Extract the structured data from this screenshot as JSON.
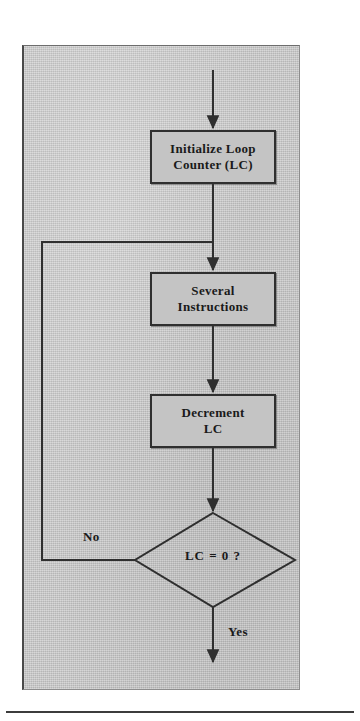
{
  "figure": {
    "panel": {
      "background_color": "#c9c9c9",
      "border_color": "#4a4a4a"
    },
    "nodes": [
      {
        "id": "initialize-loop-counter",
        "type": "process",
        "lines": [
          "Initialize Loop",
          "Counter (LC)"
        ]
      },
      {
        "id": "several-instructions",
        "type": "process",
        "lines": [
          "Several",
          "Instructions"
        ]
      },
      {
        "id": "decrement-lc",
        "type": "process",
        "lines": [
          "Decrement",
          "LC"
        ]
      },
      {
        "id": "lc-equals-zero",
        "type": "decision",
        "text": "LC = 0 ?"
      }
    ],
    "edges": [
      {
        "id": "entry-arrow",
        "from": "",
        "to": "initialize-loop-counter",
        "label": ""
      },
      {
        "id": "init-to-several",
        "from": "initialize-loop-counter",
        "to": "several-instructions",
        "label": ""
      },
      {
        "id": "several-to-decrement",
        "from": "several-instructions",
        "to": "decrement-lc",
        "label": ""
      },
      {
        "id": "decrement-to-decision",
        "from": "decrement-lc",
        "to": "lc-equals-zero",
        "label": ""
      },
      {
        "id": "decision-no-loopback",
        "from": "lc-equals-zero",
        "to": "several-instructions",
        "label": "No"
      },
      {
        "id": "decision-yes-exit",
        "from": "lc-equals-zero",
        "to": "",
        "label": "Yes"
      }
    ],
    "branch_labels": {
      "no": "No",
      "yes": "Yes"
    },
    "colors": {
      "line": "#2f2f2f",
      "box_fill": "#c4c4c4",
      "text": "#1a1a1a",
      "panel_fill": "#c9c9c9"
    }
  }
}
